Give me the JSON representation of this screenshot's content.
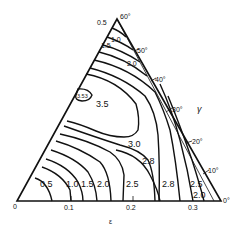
{
  "diagram": {
    "type": "ternary-contour-plot",
    "x_axis": {
      "label": "ε",
      "ticks": [
        "0",
        "0.1",
        "0.2",
        "0.3"
      ]
    },
    "angle_axis": {
      "label": "γ",
      "ticks": [
        "60°",
        "50°",
        "40°",
        "30°",
        "20°",
        "10°",
        "0°"
      ]
    },
    "contour_labels": {
      "top_0_5": "0.5",
      "top_1_0": "1.0",
      "top_1_5": "1.5",
      "top_2_0": "2.0",
      "peak": "3.53",
      "c3_5": "3.5",
      "c3_0": "3.0",
      "c2_8_mid": "2.8",
      "bottom_0_5": "0.5",
      "bottom_1_0": "1.0",
      "bottom_1_5": "1.5",
      "bottom_2_0": "2.0",
      "bottom_2_5": "2.5",
      "bottom_2_8": "2.8",
      "right_2_5": "2.5",
      "right_2_0": "2.0"
    }
  }
}
